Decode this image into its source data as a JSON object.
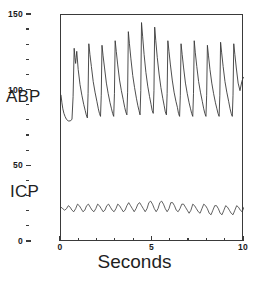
{
  "figure": {
    "background_color": "#ffffff",
    "line_color": "#3a3a3a",
    "axis_color": "#3a3a3a"
  },
  "axis_title": "Seconds",
  "caption_sliver": "",
  "series_labels": {
    "abp": "ABP",
    "icp": "ICP"
  },
  "y_axis": {
    "labels": [
      "0",
      "50",
      "100",
      "150"
    ],
    "label_values": [
      0,
      50,
      100,
      150
    ],
    "minor_step": 10
  },
  "x_axis": {
    "labels": [
      "0",
      "5",
      "10"
    ],
    "label_values": [
      0,
      5,
      10
    ],
    "minor_step": 1
  },
  "chart_data": {
    "type": "line",
    "title": "",
    "subtitle": "",
    "xlabel": "Seconds",
    "ylabel": "",
    "xlim": [
      0,
      10
    ],
    "ylim": [
      0,
      150
    ],
    "grid": false,
    "legend": "inline-left-annotations",
    "xticks": [
      0,
      5,
      10
    ],
    "xticks_minor_step": 1,
    "yticks": [
      0,
      50,
      100,
      150
    ],
    "yticks_minor_step": 10,
    "annotations": [
      {
        "text": "ABP",
        "x": -0.9,
        "y": 98,
        "note": "label left of axis for arterial blood pressure trace"
      },
      {
        "text": "ICP",
        "x": -0.9,
        "y": 38,
        "note": "label left of axis for intracranial pressure trace"
      }
    ],
    "series": [
      {
        "name": "ABP",
        "units": "mmHg",
        "systolic_range": [
          128,
          145
        ],
        "diastolic_range": [
          78,
          84
        ],
        "beats": 14,
        "period_seconds": 0.72,
        "x": [
          0.0,
          0.05,
          0.1,
          0.16,
          0.22,
          0.3,
          0.4,
          0.5,
          0.6,
          0.66,
          0.72,
          0.76,
          0.8,
          0.86,
          0.94,
          1.04,
          1.14,
          1.24,
          1.32,
          1.38,
          1.44,
          1.48,
          1.52,
          1.58,
          1.66,
          1.76,
          1.86,
          1.96,
          2.04,
          2.1,
          2.16,
          2.2,
          2.24,
          2.3,
          2.38,
          2.48,
          2.58,
          2.68,
          2.76,
          2.82,
          2.88,
          2.92,
          2.96,
          3.02,
          3.1,
          3.2,
          3.3,
          3.4,
          3.48,
          3.54,
          3.6,
          3.64,
          3.68,
          3.74,
          3.82,
          3.92,
          4.02,
          4.12,
          4.2,
          4.26,
          4.32,
          4.36,
          4.4,
          4.46,
          4.54,
          4.64,
          4.74,
          4.84,
          4.92,
          4.98,
          5.04,
          5.08,
          5.12,
          5.18,
          5.26,
          5.36,
          5.46,
          5.56,
          5.64,
          5.7,
          5.76,
          5.8,
          5.84,
          5.9,
          5.98,
          6.08,
          6.18,
          6.28,
          6.36,
          6.42,
          6.48,
          6.52,
          6.56,
          6.62,
          6.7,
          6.8,
          6.9,
          7.0,
          7.08,
          7.14,
          7.2,
          7.24,
          7.28,
          7.34,
          7.42,
          7.52,
          7.62,
          7.72,
          7.8,
          7.86,
          7.92,
          7.96,
          8.0,
          8.06,
          8.14,
          8.24,
          8.34,
          8.44,
          8.52,
          8.58,
          8.64,
          8.68,
          8.72,
          8.78,
          8.86,
          8.96,
          9.06,
          9.16,
          9.24,
          9.3,
          9.36,
          9.4,
          9.44,
          9.5,
          9.58,
          9.68,
          9.78,
          9.88,
          9.94,
          10.0
        ],
        "y": [
          97,
          92,
          88,
          85,
          83,
          81,
          80,
          80,
          81,
          96,
          128,
          122,
          118,
          126,
          114,
          104,
          97,
          91,
          87,
          84,
          82,
          98,
          131,
          124,
          116,
          106,
          99,
          93,
          88,
          85,
          83,
          97,
          130,
          123,
          115,
          105,
          98,
          92,
          88,
          85,
          83,
          98,
          133,
          126,
          117,
          107,
          100,
          94,
          89,
          86,
          84,
          99,
          139,
          131,
          121,
          110,
          102,
          95,
          90,
          87,
          84,
          100,
          145,
          136,
          124,
          112,
          103,
          96,
          91,
          87,
          85,
          100,
          142,
          133,
          122,
          111,
          102,
          95,
          90,
          86,
          84,
          98,
          133,
          126,
          117,
          107,
          99,
          93,
          89,
          85,
          83,
          97,
          131,
          124,
          115,
          105,
          98,
          92,
          88,
          85,
          83,
          98,
          133,
          125,
          116,
          106,
          99,
          93,
          88,
          85,
          83,
          97,
          130,
          123,
          114,
          105,
          98,
          92,
          88,
          85,
          83,
          97,
          132,
          125,
          116,
          106,
          99,
          93,
          88,
          85,
          83,
          97,
          131,
          124,
          115,
          105,
          100,
          106,
          108,
          109
        ]
      },
      {
        "name": "ICP",
        "units": "mmHg",
        "peak_range": [
          24,
          27
        ],
        "trough_range": [
          17,
          20
        ],
        "mean": 22,
        "beats": 14,
        "period_seconds": 0.72,
        "x": [
          0.0,
          0.1,
          0.2,
          0.3,
          0.4,
          0.5,
          0.6,
          0.7,
          0.8,
          0.9,
          1.0,
          1.1,
          1.2,
          1.3,
          1.4,
          1.5,
          1.6,
          1.7,
          1.8,
          1.9,
          2.0,
          2.1,
          2.2,
          2.3,
          2.4,
          2.5,
          2.6,
          2.7,
          2.8,
          2.9,
          3.0,
          3.1,
          3.2,
          3.3,
          3.4,
          3.5,
          3.6,
          3.7,
          3.8,
          3.9,
          4.0,
          4.1,
          4.2,
          4.3,
          4.4,
          4.5,
          4.6,
          4.7,
          4.8,
          4.9,
          5.0,
          5.1,
          5.2,
          5.3,
          5.4,
          5.5,
          5.6,
          5.7,
          5.8,
          5.9,
          6.0,
          6.1,
          6.2,
          6.3,
          6.4,
          6.5,
          6.6,
          6.7,
          6.8,
          6.9,
          7.0,
          7.1,
          7.2,
          7.3,
          7.4,
          7.5,
          7.6,
          7.7,
          7.8,
          7.9,
          8.0,
          8.1,
          8.2,
          8.3,
          8.4,
          8.5,
          8.6,
          8.7,
          8.8,
          8.9,
          9.0,
          9.1,
          9.2,
          9.3,
          9.4,
          9.5,
          9.6,
          9.7,
          9.8,
          9.9,
          10.0
        ],
        "y": [
          23,
          22,
          21,
          22,
          24,
          23,
          21,
          20,
          22,
          25,
          24,
          22,
          20,
          21,
          24,
          25,
          23,
          21,
          20,
          22,
          25,
          24,
          22,
          20,
          21,
          24,
          25,
          23,
          21,
          20,
          22,
          25,
          24,
          22,
          20,
          21,
          24,
          26,
          24,
          22,
          20,
          22,
          25,
          26,
          24,
          22,
          20,
          22,
          26,
          27,
          25,
          22,
          20,
          22,
          26,
          27,
          25,
          22,
          20,
          22,
          26,
          26,
          24,
          21,
          20,
          22,
          25,
          25,
          23,
          21,
          19,
          21,
          25,
          24,
          22,
          20,
          19,
          22,
          25,
          24,
          22,
          19,
          18,
          21,
          24,
          24,
          22,
          19,
          18,
          21,
          24,
          23,
          21,
          19,
          18,
          21,
          24,
          23,
          21,
          20,
          23
        ]
      }
    ]
  }
}
